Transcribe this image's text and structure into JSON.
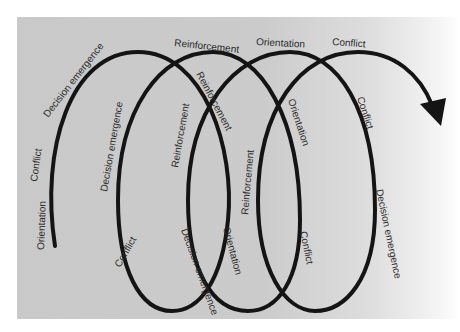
{
  "diagram": {
    "type": "spiral",
    "colors": {
      "background": "#cbcbcb",
      "line": "#141414",
      "text": "#2a2a2a"
    },
    "labels": {
      "l1": "Orientation",
      "l2": "Conflict",
      "l3": "Decision emergence",
      "l4": "Reinforcement",
      "l5": "Decision emergence",
      "l6": "Reinforcement",
      "l7": "Conflict",
      "l8": "Decision emergence",
      "l9": "Reinforcement",
      "l10": "Orientation",
      "l11": "Reinforcement",
      "l12": "Orientation",
      "l13": "Orientation",
      "l14": "Conflict",
      "l15": "Conflict",
      "l16": "Decision emergence"
    },
    "phases": [
      "Orientation",
      "Conflict",
      "Decision emergence",
      "Reinforcement"
    ],
    "end_marker": "arrowhead"
  }
}
